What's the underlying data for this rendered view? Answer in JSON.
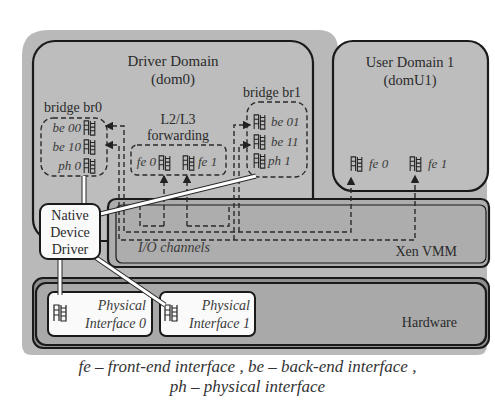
{
  "diagram": {
    "colors": {
      "background": "#ffffff",
      "outer_panel": "#b9b9b9",
      "domain_fill": "#bdbdbd",
      "vmm_fill": "#adadad",
      "hardware_band": "#8f8f8f",
      "hardware_fill": "#a9a9a9",
      "white_box": "#fafafa",
      "stroke": "#1a1a1a"
    },
    "driver_domain": {
      "title": "Driver Domain",
      "subtitle": "(dom0)",
      "bridge_br0": {
        "label": "bridge br0",
        "interfaces": [
          "be 00",
          "be 10",
          "ph 0"
        ]
      },
      "forwarding": {
        "label_line1": "L2/L3",
        "label_line2": "forwarding",
        "interfaces": [
          "fe 0",
          "fe 1"
        ]
      },
      "bridge_br1": {
        "label": "bridge br1",
        "interfaces": [
          "be 01",
          "be 11",
          "ph 1"
        ]
      }
    },
    "user_domain": {
      "title": "User Domain 1",
      "subtitle": "(domU1)",
      "interfaces": [
        "fe 0",
        "fe 1"
      ]
    },
    "native_driver": {
      "line1": "Native",
      "line2": "Device",
      "line3": "Driver"
    },
    "xen_vmm": {
      "label": "Xen VMM",
      "io_label": "I/O channels"
    },
    "hardware": {
      "label": "Hardware",
      "physical_interfaces": [
        {
          "line1": "Physical",
          "line2": "Interface 0"
        },
        {
          "line1": "Physical",
          "line2": "Interface 1"
        }
      ]
    },
    "caption": {
      "line1": "fe – front-end interface , be – back-end interface ,",
      "line2": "ph – physical interface"
    }
  }
}
